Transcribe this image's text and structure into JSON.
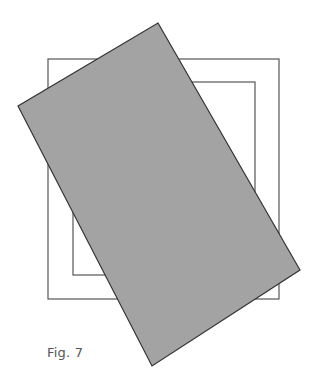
{
  "figure": {
    "caption": "Fig. 7",
    "colors": {
      "background": "#ffffff",
      "line": "#555555",
      "fill": "#a3a3a3",
      "fill_stroke": "#333333"
    },
    "shapes": {
      "outer_square": {
        "x": 48,
        "y": 59,
        "width": 231,
        "height": 240
      },
      "inner_square": {
        "x": 73,
        "y": 82,
        "width": 182,
        "height": 193
      },
      "rotated_rectangle": {
        "points": "158,23 300,270 152,366 18,106"
      }
    }
  }
}
